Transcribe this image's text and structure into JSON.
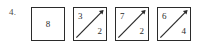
{
  "worksheet": {
    "item_number": "4.",
    "background_color": "#ffffff",
    "ink_color": "#2b2b2b",
    "boxes": [
      {
        "type": "plain",
        "center_value": "8",
        "has_diagonal": false,
        "diagonal_icon": "diagonal-arrow-up-right-icon"
      },
      {
        "type": "split",
        "top_left_value": "3",
        "bottom_right_value": "2",
        "has_diagonal": true,
        "diagonal_icon": "diagonal-arrow-up-right-icon"
      },
      {
        "type": "split",
        "top_left_value": "7",
        "bottom_right_value": "2",
        "has_diagonal": true,
        "diagonal_icon": "diagonal-arrow-up-right-icon"
      },
      {
        "type": "split",
        "top_left_value": "6",
        "bottom_right_value": "4",
        "has_diagonal": true,
        "diagonal_icon": "diagonal-arrow-up-right-icon"
      }
    ]
  }
}
